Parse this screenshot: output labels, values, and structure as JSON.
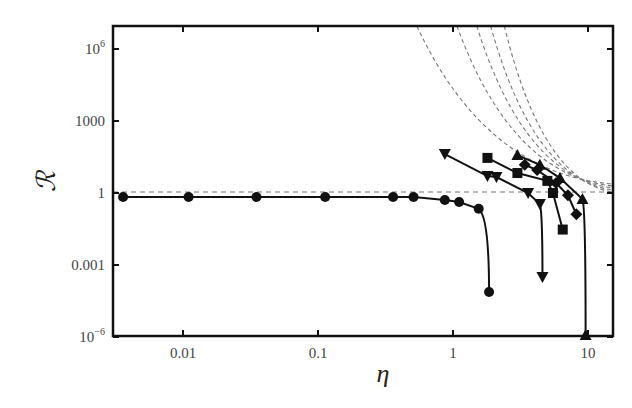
{
  "chart_data": {
    "type": "line",
    "title": "",
    "xlabel": "η",
    "ylabel": "ℛ",
    "xscale": "log",
    "yscale": "log",
    "xlim": [
      0.003,
      15.6
    ],
    "ylim": [
      1e-06,
      8000000.0
    ],
    "grid": false,
    "legend": null,
    "x_ticks": [
      {
        "value": 0.01,
        "label": "0.01"
      },
      {
        "value": 0.1,
        "label": "0.1"
      },
      {
        "value": 1,
        "label": "1"
      },
      {
        "value": 10,
        "label": "10"
      }
    ],
    "y_ticks": [
      {
        "value": 1e-06,
        "label": "10",
        "sup": "−6"
      },
      {
        "value": 0.001,
        "label": "0.001",
        "sup": ""
      },
      {
        "value": 1,
        "label": "1",
        "sup": ""
      },
      {
        "value": 1000,
        "label": "1000",
        "sup": ""
      },
      {
        "value": 1000000.0,
        "label": "10",
        "sup": "6"
      }
    ],
    "series": [
      {
        "name": "circles",
        "marker": "circle",
        "x": [
          0.0036,
          0.011,
          0.035,
          0.113,
          0.36,
          0.51,
          0.87,
          1.11,
          1.55,
          1.85
        ],
        "y": [
          0.68,
          0.68,
          0.68,
          0.68,
          0.68,
          0.68,
          0.51,
          0.42,
          0.22,
          7.5e-05
        ]
      },
      {
        "name": "triangles-down",
        "marker": "triangle-down",
        "x": [
          0.87,
          1.8,
          2.1,
          3.6,
          4.4,
          4.6
        ],
        "y": [
          42,
          5.1,
          4.6,
          1.0,
          0.35,
          0.00032
        ]
      },
      {
        "name": "squares",
        "marker": "square",
        "x": [
          1.8,
          3.0,
          5.0,
          5.5,
          6.5
        ],
        "y": [
          29,
          6.8,
          3.2,
          1.0,
          0.03
        ]
      },
      {
        "name": "diamonds",
        "marker": "diamond",
        "x": [
          3.4,
          4.2,
          5.8,
          7.1,
          8.2
        ],
        "y": [
          15,
          9,
          2.6,
          0.8,
          0.13
        ]
      },
      {
        "name": "triangles-up",
        "marker": "triangle-up",
        "x": [
          3.0,
          4.4,
          6.2,
          9.1,
          9.6
        ],
        "y": [
          38,
          15,
          4.2,
          0.56,
          1e-06
        ]
      }
    ],
    "reference_lines": [
      {
        "type": "horizontal",
        "y": 1,
        "style": "dashed"
      },
      {
        "type": "curves",
        "style": "dashed",
        "count": 5,
        "description": "diverging dashed curves falling from top toward R=1 near right edge",
        "top_x": [
          0.54,
          1.07,
          1.5,
          1.9,
          2.4
        ]
      }
    ]
  }
}
